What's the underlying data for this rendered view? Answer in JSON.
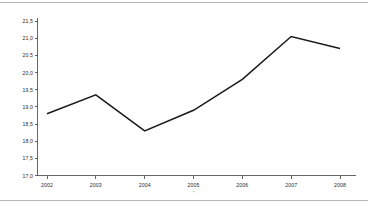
{
  "chart_data": {
    "type": "line",
    "title": "",
    "subtitle": "",
    "xlabel": "",
    "ylabel": "",
    "categories": [
      "2002",
      "2003",
      "2004",
      "2005",
      "2006",
      "2007",
      "2008"
    ],
    "x": [
      2002,
      2003,
      2004,
      2005,
      2006,
      2007,
      2008
    ],
    "values": [
      18.8,
      19.35,
      18.3,
      18.9,
      19.8,
      21.05,
      20.7
    ],
    "series": [
      {
        "name": "",
        "values": [
          18.8,
          19.35,
          18.3,
          18.9,
          19.8,
          21.05,
          20.7
        ],
        "color": "#1a1a1a"
      }
    ],
    "ylim": [
      17.0,
      21.5
    ],
    "xlim": [
      2001.6,
      2008.4
    ],
    "yticks": [
      17.0,
      17.5,
      18.0,
      18.5,
      19.0,
      19.5,
      20.0,
      20.5,
      21.0,
      21.5
    ],
    "ytick_labels": [
      "17,0",
      "17,5",
      "18,0",
      "18,5",
      "19,0",
      "19,5",
      "20,0",
      "20,5",
      "21,0",
      "21,5"
    ],
    "xtick_labels": [
      "2002",
      "2003",
      "2004",
      "2005",
      "2006",
      "2007",
      "2008"
    ],
    "grid": false,
    "legend": null,
    "legend_position": "none",
    "decimal_separator": ",",
    "annotations": [
      {
        "text": "*",
        "near_tick": "2005"
      }
    ]
  },
  "style": {
    "line_color": "#1a1a1a",
    "axis_color": "#555555",
    "frame_color": "#b8b8b8",
    "text_color": "#2b2b2b",
    "background": "#ffffff"
  }
}
